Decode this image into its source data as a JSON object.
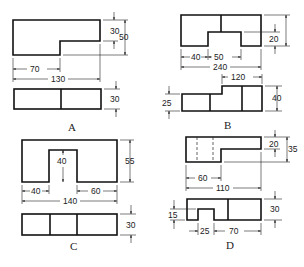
{
  "figure": {
    "options": [
      {
        "label": "A",
        "front_view_dims": {
          "step_height": "30",
          "total_height": "50",
          "step_width": "70",
          "total_width": "130"
        },
        "top_view_dims": {
          "depth": "30"
        }
      },
      {
        "label": "B",
        "front_view_dims": {
          "total_height": "45",
          "notch_height": "20",
          "left_width": "40",
          "notch_width": "50",
          "total_width": "240"
        },
        "top_view_dims": {
          "right_width": "120",
          "left_depth": "25",
          "right_depth": "40"
        }
      },
      {
        "label": "C",
        "front_view_dims": {
          "total_height": "55",
          "notch_height": "40",
          "left_width": "40",
          "right_width": "60",
          "total_width": "140"
        },
        "top_view_dims": {
          "depth": "30"
        }
      },
      {
        "label": "D",
        "front_view_dims": {
          "step_height": "20",
          "total_height": "35",
          "left_width": "60",
          "total_width": "110"
        },
        "top_view_dims": {
          "notch_depth": "15",
          "depth": "30",
          "notch_width": "25",
          "right_width": "70"
        }
      }
    ]
  }
}
